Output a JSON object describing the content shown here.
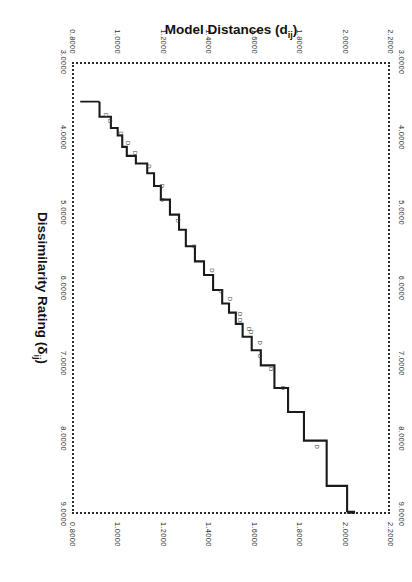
{
  "figure": {
    "orientation_deg": 90,
    "background": "#ffffff",
    "line_color": "#1a1a1a",
    "frame_style": "dotted"
  },
  "chart_data": {
    "type": "line",
    "title": "",
    "subtitle": "",
    "xlabel": "Dissimilarity Rating (δij)",
    "xlabel_main": "Dissimilarity Rating (",
    "xlabel_symbol": "δ",
    "xlabel_subscript": "ij",
    "xlabel_close": ")",
    "ylabel": "Model Distances (dij)",
    "ylabel_main": "Model Distances (d",
    "ylabel_subscript": "ij",
    "ylabel_close": ")",
    "xlim": [
      3.0,
      9.0
    ],
    "ylim": [
      0.8,
      2.2
    ],
    "grid": false,
    "legend": null,
    "xticks": [
      "3.0000",
      "4.0000",
      "5.0000",
      "6.0000",
      "7.0000",
      "8.0000",
      "9.0000"
    ],
    "xtick_values": [
      3.0,
      4.0,
      5.0,
      6.0,
      7.0,
      8.0,
      9.0
    ],
    "yticks": [
      "0.8000",
      "1.0000",
      "1.2000",
      "1.4000",
      "1.6000",
      "1.8000",
      "2.0000",
      "2.2000"
    ],
    "ytick_values": [
      0.8,
      1.0,
      1.2,
      1.4,
      1.6,
      1.8,
      2.0,
      2.2
    ],
    "series": [
      {
        "name": "monotone-step-fit",
        "style": "step",
        "x": [
          3.5,
          3.7,
          3.7,
          3.85,
          3.85,
          3.95,
          3.95,
          4.1,
          4.1,
          4.22,
          4.22,
          4.32,
          4.32,
          4.45,
          4.45,
          4.62,
          4.62,
          4.8,
          4.8,
          5.0,
          5.0,
          5.2,
          5.2,
          5.42,
          5.42,
          5.62,
          5.62,
          5.8,
          5.8,
          6.0,
          6.0,
          6.18,
          6.18,
          6.3,
          6.3,
          6.45,
          6.45,
          6.62,
          6.62,
          6.8,
          6.8,
          7.0,
          7.0,
          7.3,
          7.3,
          7.62,
          7.62,
          8.0,
          8.0,
          8.6,
          8.6,
          8.95
        ],
        "y": [
          0.93,
          0.93,
          0.98,
          0.98,
          1.01,
          1.01,
          1.03,
          1.03,
          1.05,
          1.05,
          1.09,
          1.09,
          1.14,
          1.14,
          1.17,
          1.17,
          1.2,
          1.2,
          1.24,
          1.24,
          1.28,
          1.28,
          1.31,
          1.31,
          1.35,
          1.35,
          1.39,
          1.39,
          1.43,
          1.43,
          1.47,
          1.47,
          1.5,
          1.5,
          1.53,
          1.53,
          1.56,
          1.56,
          1.6,
          1.6,
          1.64,
          1.64,
          1.7,
          1.7,
          1.76,
          1.76,
          1.83,
          1.83,
          1.93,
          1.93,
          2.02,
          2.02
        ]
      }
    ],
    "points": [
      {
        "label": "D",
        "x": 3.68,
        "y": 0.93
      },
      {
        "label": "D",
        "x": 3.76,
        "y": 0.95
      },
      {
        "label": "D",
        "x": 3.92,
        "y": 1.0
      },
      {
        "label": "D",
        "x": 4.05,
        "y": 1.03
      },
      {
        "label": "D",
        "x": 4.18,
        "y": 1.06
      },
      {
        "label": "D",
        "x": 4.36,
        "y": 1.12
      },
      {
        "label": "D",
        "x": 4.62,
        "y": 1.18
      },
      {
        "label": "D",
        "x": 4.8,
        "y": 1.18
      },
      {
        "label": "D",
        "x": 5.08,
        "y": 1.25
      },
      {
        "label": "D",
        "x": 5.42,
        "y": 1.32
      },
      {
        "label": "D",
        "x": 5.74,
        "y": 1.4
      },
      {
        "label": "D",
        "x": 6.02,
        "y": 1.44
      },
      {
        "label": "D",
        "x": 6.12,
        "y": 1.48
      },
      {
        "label": "D",
        "x": 6.32,
        "y": 1.52
      },
      {
        "label": "D",
        "x": 6.4,
        "y": 1.52
      },
      {
        "label": "D",
        "x": 6.52,
        "y": 1.56
      },
      {
        "label": "D",
        "x": 6.56,
        "y": 1.57
      },
      {
        "label": "D",
        "x": 6.7,
        "y": 1.61
      },
      {
        "label": "D",
        "x": 6.88,
        "y": 1.61
      },
      {
        "label": "D",
        "x": 7.05,
        "y": 1.66
      },
      {
        "label": "D",
        "x": 7.3,
        "y": 1.71
      },
      {
        "label": "D",
        "x": 8.08,
        "y": 1.86
      }
    ]
  }
}
